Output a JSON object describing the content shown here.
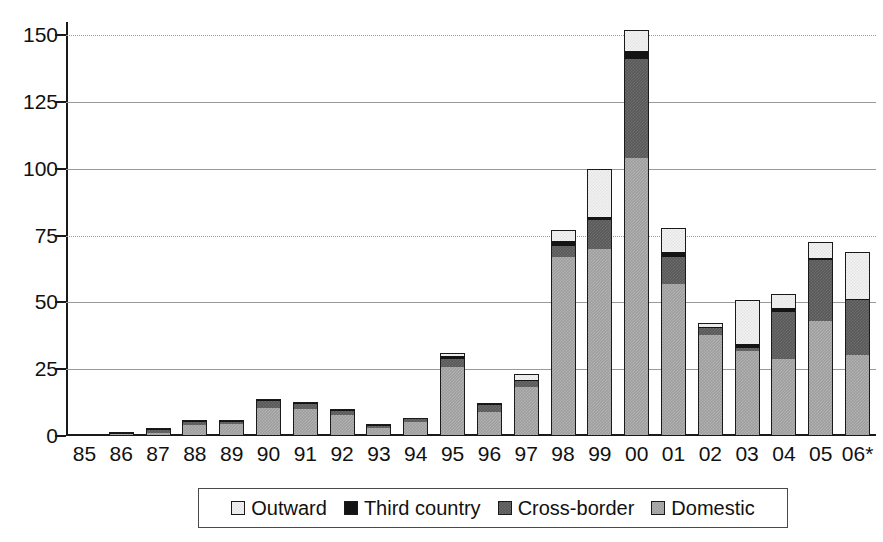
{
  "chart_data": {
    "type": "bar",
    "title": "",
    "subtitle": "",
    "xlabel": "",
    "ylabel": "",
    "stacked": true,
    "grid": true,
    "legend_position": "bottom",
    "ylim": [
      0,
      155
    ],
    "yticks": [
      0,
      25,
      50,
      75,
      100,
      125,
      150
    ],
    "ytick_labels": [
      "0",
      "25",
      "50",
      "75",
      "100",
      "125",
      "150"
    ],
    "categories": [
      "85",
      "86",
      "87",
      "88",
      "89",
      "90",
      "91",
      "92",
      "93",
      "94",
      "95",
      "96",
      "97",
      "98",
      "99",
      "00",
      "01",
      "02",
      "03",
      "04",
      "05",
      "06*"
    ],
    "series": [
      {
        "name": "Domestic",
        "color": "#9d9d9d",
        "values": [
          0.4,
          0.6,
          1.1,
          4.3,
          4.5,
          10.5,
          10.0,
          8.0,
          3.0,
          5.3,
          25.8,
          9.0,
          18.5,
          67.0,
          70.0,
          104.0,
          57.0,
          38.0,
          32.0,
          29.0,
          43.0,
          30.5
        ]
      },
      {
        "name": "Cross-border",
        "color": "#585858",
        "values": [
          0.1,
          0.3,
          1.2,
          1.0,
          0.8,
          2.5,
          2.0,
          1.5,
          0.8,
          1.0,
          3.2,
          2.5,
          2.2,
          4.0,
          11.0,
          37.0,
          10.0,
          2.5,
          1.0,
          17.5,
          23.0,
          20.5
        ]
      },
      {
        "name": "Third country",
        "color": "#141414",
        "values": [
          0.0,
          0.6,
          0.2,
          0.2,
          0.2,
          0.6,
          0.5,
          0.3,
          0.2,
          0.2,
          0.8,
          0.3,
          0.4,
          2.0,
          1.0,
          3.0,
          2.0,
          0.4,
          1.5,
          1.5,
          0.6,
          0.4
        ]
      },
      {
        "name": "Outward",
        "color": "#f2f2f2",
        "values": [
          0.0,
          0.0,
          0.2,
          0.3,
          0.2,
          0.4,
          0.3,
          0.3,
          0.2,
          0.2,
          1.2,
          0.6,
          2.2,
          4.0,
          18.0,
          8.0,
          9.0,
          1.5,
          16.5,
          5.0,
          5.9,
          17.6
        ]
      }
    ],
    "totals": [
      0.5,
      1.5,
      2.7,
      5.8,
      5.7,
      14.0,
      12.8,
      10.1,
      4.2,
      6.7,
      31.0,
      12.4,
      23.3,
      77.0,
      100.0,
      152.0,
      78.0,
      42.4,
      51.0,
      53.0,
      72.5,
      69.0
    ]
  },
  "legend": {
    "items": [
      {
        "label": "Outward",
        "swatch": "outward"
      },
      {
        "label": "Third country",
        "swatch": "third"
      },
      {
        "label": "Cross-border",
        "swatch": "crossborder"
      },
      {
        "label": "Domestic",
        "swatch": "domestic"
      }
    ]
  }
}
